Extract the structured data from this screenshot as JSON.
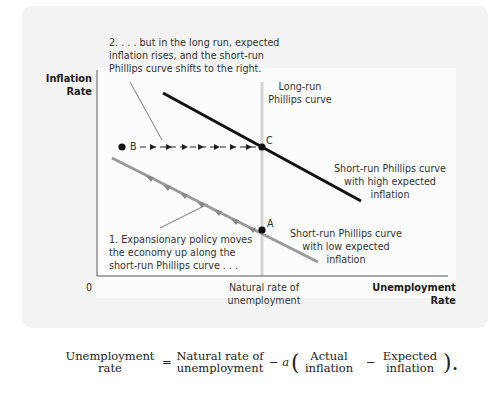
{
  "diagram": {
    "type": "phillips-curve-shift",
    "y_axis_label": [
      "Inflation",
      "Rate"
    ],
    "x_axis_label": [
      "Unemployment",
      "Rate"
    ],
    "origin_label": "0",
    "natural_rate_label": [
      "Natural rate of",
      "unemployment"
    ],
    "long_run_curve_label": [
      "Long-run",
      "Phillips curve"
    ],
    "high_curve_label": [
      "Short-run Phillips curve",
      "with high expected",
      "inflation"
    ],
    "low_curve_label": [
      "Short-run Phillips curve",
      "with low expected",
      "inflation"
    ],
    "annotation_1": [
      "1. Expansionary policy moves",
      "the economy up along the",
      "short-run Phillips curve . . ."
    ],
    "annotation_2": [
      "2. . . . but in the long run, expected",
      "inflation rises, and the short-run",
      "Phillips curve shifts to the right."
    ],
    "points": [
      {
        "label": "A",
        "x": 262,
        "y": 230
      },
      {
        "label": "B",
        "x": 122,
        "y": 147
      },
      {
        "label": "C",
        "x": 262,
        "y": 147
      }
    ],
    "colors": {
      "high_curve": "#111111",
      "low_curve": "#999999",
      "long_run_line": "#d8d8d8",
      "panel_bg": "#f3f3f3"
    }
  },
  "equation": {
    "lhs": [
      "Unemployment",
      "rate"
    ],
    "equals": "=",
    "term1": [
      "Natural rate of",
      "unemployment"
    ],
    "minus_a": "− a",
    "open_paren": "(",
    "term2": [
      "Actual",
      "inflation"
    ],
    "minus": "−",
    "term3": [
      "Expected",
      "inflation"
    ],
    "close_paren": ").",
    "coefficient": "a"
  }
}
